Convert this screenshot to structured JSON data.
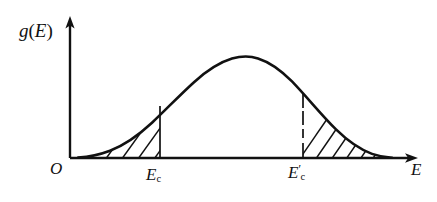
{
  "figure": {
    "background_color": "#ffffff",
    "ink_color": "#111111"
  },
  "axes": {
    "y_axis": {
      "label": "g(E)",
      "label_plain": "g(E)",
      "variable": "g",
      "argument": "E",
      "arrow": true,
      "x": 70,
      "y_top": 18,
      "y_bottom": 158
    },
    "x_axis": {
      "label": "E",
      "arrow": true,
      "y": 158,
      "x_left": 70,
      "x_right": 417
    },
    "origin": {
      "label": "O"
    }
  },
  "markers": [
    {
      "name": "mobility-edge-lower",
      "label_base": "E",
      "label_sub": "c",
      "label_prime": "",
      "label_plain": "Ec",
      "x": 160,
      "y_top": 105,
      "y_bottom": 158,
      "style": "solid"
    },
    {
      "name": "mobility-edge-upper",
      "label_base": "E",
      "label_sub": "c",
      "label_prime": "′",
      "label_plain": "Ec'",
      "x": 303,
      "y_top": 100,
      "y_bottom": 158,
      "style": "dashed"
    }
  ],
  "curve": {
    "name": "density-of-states-curve",
    "description": "Smooth bell-shaped band of states rising from zero, flat dome peak, falling back to zero",
    "baseline_y": 158,
    "peak_y": 57,
    "peak_x": 232,
    "left_foot_x": 78,
    "right_foot_x": 390,
    "points": [
      [
        78,
        157.5
      ],
      [
        92,
        156.0
      ],
      [
        106,
        152.5
      ],
      [
        120,
        147.0
      ],
      [
        134,
        139.0
      ],
      [
        148,
        128.0
      ],
      [
        160,
        116.0
      ],
      [
        172,
        103.0
      ],
      [
        184,
        91.0
      ],
      [
        196,
        79.5
      ],
      [
        208,
        70.0
      ],
      [
        220,
        62.5
      ],
      [
        232,
        58.0
      ],
      [
        246,
        57.0
      ],
      [
        258,
        59.0
      ],
      [
        270,
        64.0
      ],
      [
        282,
        72.0
      ],
      [
        292,
        81.0
      ],
      [
        303,
        92.5
      ],
      [
        314,
        105.0
      ],
      [
        326,
        118.0
      ],
      [
        338,
        130.0
      ],
      [
        350,
        140.0
      ],
      [
        362,
        148.0
      ],
      [
        374,
        153.5
      ],
      [
        384,
        156.5
      ],
      [
        392,
        157.6
      ]
    ]
  },
  "shaded_regions": [
    {
      "name": "localized-states-low-energy",
      "description": "Hatched tail area below the curve, left of the lower mobility edge",
      "hatch_count": 4,
      "hatch_direction": "up-right",
      "x_from": 78,
      "x_to": 160
    },
    {
      "name": "localized-states-high-energy",
      "description": "Hatched tail area below the curve, right of the upper mobility edge",
      "hatch_count": 8,
      "hatch_direction": "up-right",
      "x_from": 303,
      "x_to": 390
    }
  ]
}
